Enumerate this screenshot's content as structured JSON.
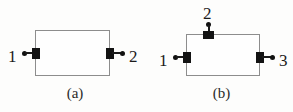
{
  "figure": {
    "background_color": "#fdfdfc",
    "line_color": "#8d8d8d",
    "marker_color": "#131313",
    "subfigures": [
      {
        "id": "a",
        "caption": "(a)",
        "port_count": 2,
        "ports": [
          {
            "label": "1",
            "side": "left"
          },
          {
            "label": "2",
            "side": "right"
          }
        ]
      },
      {
        "id": "b",
        "caption": "(b)",
        "port_count": 3,
        "ports": [
          {
            "label": "1",
            "side": "left"
          },
          {
            "label": "2",
            "side": "top"
          },
          {
            "label": "3",
            "side": "right"
          }
        ]
      }
    ]
  }
}
